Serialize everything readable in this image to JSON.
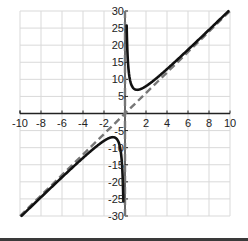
{
  "chart_data": {
    "type": "line",
    "title": "",
    "xlabel": "",
    "ylabel": "",
    "xlim": [
      -10,
      10
    ],
    "ylim": [
      -30,
      30
    ],
    "grid": true,
    "x_ticks": [
      -10,
      -8,
      -6,
      -4,
      -2,
      2,
      4,
      6,
      8,
      10
    ],
    "x_tick_labels": [
      "-10",
      "-8",
      "-6",
      "-4",
      "-2",
      "2",
      "4",
      "6",
      "8",
      "10"
    ],
    "y_ticks": [
      30,
      25,
      20,
      15,
      10,
      5,
      -5,
      -10,
      -15,
      -20,
      -25,
      -30
    ],
    "y_tick_labels": [
      "30",
      "25",
      "20",
      "15",
      "10",
      "5",
      "-5",
      "-10",
      "-15",
      "-20",
      "-25",
      "-30"
    ],
    "series": [
      {
        "name": "f(x) = 3x + 4/x",
        "style": "solid",
        "color": "#111111",
        "branches": [
          {
            "x": [
              0.134,
              0.2,
              0.3,
              0.5,
              0.8,
              1.0,
              1.15,
              1.5,
              2,
              3,
              4,
              6,
              8,
              9.87
            ],
            "y": [
              30,
              20.6,
              14.2,
              9.5,
              7.4,
              7.0,
              6.93,
              7.17,
              8,
              10.33,
              13,
              18.67,
              24.5,
              30
            ]
          },
          {
            "x": [
              -9.87,
              -8,
              -6,
              -4,
              -3,
              -2,
              -1.5,
              -1.15,
              -1.0,
              -0.8,
              -0.5,
              -0.3,
              -0.2,
              -0.134
            ],
            "y": [
              -30,
              -24.5,
              -18.67,
              -13,
              -10.33,
              -8,
              -7.17,
              -6.93,
              -7.0,
              -7.4,
              -9.5,
              -14.2,
              -20.6,
              -30
            ]
          }
        ]
      },
      {
        "name": "oblique asymptote y = 3x",
        "style": "dashed",
        "color": "#777777",
        "x": [
          -10,
          10
        ],
        "y": [
          -30,
          30
        ]
      },
      {
        "name": "vertical asymptote x = 0",
        "style": "dashed",
        "color": "#777777",
        "x": [
          0,
          0
        ],
        "y": [
          -30,
          30
        ]
      }
    ],
    "annotations": []
  },
  "colors": {
    "curve": "#111111",
    "asymptote": "#777777",
    "grid": "#d9d9d9",
    "axis": "#222222"
  }
}
